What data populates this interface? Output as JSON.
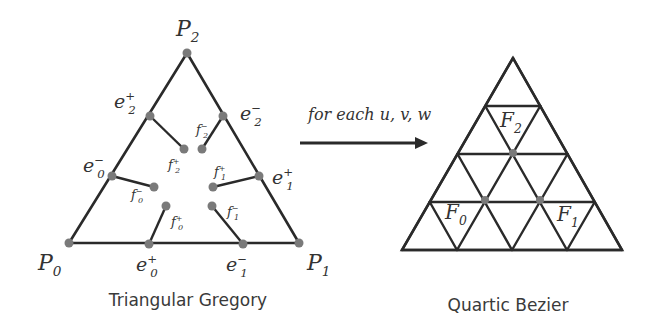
{
  "diagram": {
    "left": {
      "caption": "Triangular Gregory",
      "corners": [
        {
          "name": "P",
          "sub": "0",
          "sup": "",
          "x": 69,
          "y": 243,
          "lx": 38,
          "ly": 270
        },
        {
          "name": "P",
          "sub": "1",
          "sup": "",
          "x": 299,
          "y": 243,
          "lx": 307,
          "ly": 270
        },
        {
          "name": "P",
          "sub": "2",
          "sup": "",
          "x": 187,
          "y": 53,
          "lx": 176,
          "ly": 36
        }
      ],
      "edge_points": [
        {
          "name": "e",
          "sub": "2",
          "sup": "+",
          "x": 150,
          "y": 116,
          "lx": 114,
          "ly": 108
        },
        {
          "name": "e",
          "sub": "2",
          "sup": "−",
          "x": 223,
          "y": 116,
          "lx": 240,
          "ly": 120
        },
        {
          "name": "e",
          "sub": "0",
          "sup": "−",
          "x": 112,
          "y": 176,
          "lx": 83,
          "ly": 172
        },
        {
          "name": "e",
          "sub": "1",
          "sup": "+",
          "x": 259,
          "y": 176,
          "lx": 272,
          "ly": 184
        },
        {
          "name": "e",
          "sub": "0",
          "sup": "+",
          "x": 149,
          "y": 244,
          "lx": 136,
          "ly": 271
        },
        {
          "name": "e",
          "sub": "1",
          "sup": "−",
          "x": 243,
          "y": 244,
          "lx": 226,
          "ly": 271
        }
      ],
      "face_points": [
        {
          "name": "f",
          "sub": "2",
          "sup": "+",
          "x": 184,
          "y": 149,
          "from": 0,
          "lx": 168,
          "ly": 169
        },
        {
          "name": "f",
          "sub": "2",
          "sup": "−",
          "x": 202,
          "y": 149,
          "from": 1,
          "lx": 196,
          "ly": 134
        },
        {
          "name": "f",
          "sub": "0",
          "sup": "−",
          "x": 154,
          "y": 187,
          "from": 2,
          "lx": 131,
          "ly": 199
        },
        {
          "name": "f",
          "sub": "1",
          "sup": "+",
          "x": 213,
          "y": 187,
          "from": 3,
          "lx": 214,
          "ly": 176
        },
        {
          "name": "f",
          "sub": "0",
          "sup": "+",
          "x": 166,
          "y": 206,
          "from": 4,
          "lx": 171,
          "ly": 226
        },
        {
          "name": "f",
          "sub": "1",
          "sup": "−",
          "x": 212,
          "y": 206,
          "from": 5,
          "lx": 227,
          "ly": 216
        }
      ]
    },
    "arrow": {
      "label": "for each u, v, w",
      "x1": 300,
      "y1": 143,
      "x2": 428,
      "y2": 143,
      "lx": 308,
      "ly": 120
    },
    "right": {
      "caption": "Quartic Bezier",
      "apex": {
        "x": 513,
        "y": 58
      },
      "base_left": {
        "x": 402,
        "y": 250
      },
      "base_right": {
        "x": 622,
        "y": 250
      },
      "degree": 4,
      "dots": [
        {
          "x": 513,
          "y": 153
        },
        {
          "x": 485,
          "y": 200
        },
        {
          "x": 540,
          "y": 200
        }
      ],
      "labels": [
        {
          "name": "F",
          "sub": "2",
          "x": 500,
          "y": 127
        },
        {
          "name": "F",
          "sub": "0",
          "x": 445,
          "y": 219
        },
        {
          "name": "F",
          "sub": "1",
          "x": 557,
          "y": 221
        }
      ]
    },
    "colors": {
      "line": "#2a2a2a",
      "dot": "#7a7a7a",
      "text": "#333333"
    }
  }
}
